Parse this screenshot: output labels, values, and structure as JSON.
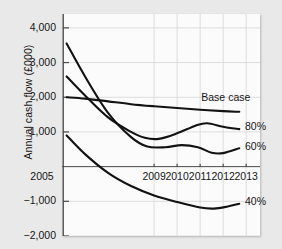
{
  "chart_data": {
    "type": "line",
    "title": "",
    "xlabel": "",
    "ylabel": "Annual cash flow (£000)",
    "xlim": [
      2005,
      2013.6
    ],
    "ylim": [
      -2000,
      4400
    ],
    "grid": true,
    "legend_position": "right-inline",
    "y_ticks": [
      4000,
      3000,
      2000,
      1000,
      -1000,
      -2000
    ],
    "y_tick_labels": [
      "4,000",
      "3,000",
      "2,000",
      "1,000",
      "−1,000",
      "−2,000"
    ],
    "x_ticks": [
      2005,
      2009,
      2010,
      2011,
      2012,
      2013
    ],
    "x_tick_labels": [
      "2005",
      "2009",
      "2010",
      "2011",
      "2012",
      "2013"
    ],
    "zero_axis": 0,
    "series": [
      {
        "name": "Base case",
        "label": "Base case",
        "color": "#121212",
        "x": [
          2005.2,
          2006.0,
          2007.0,
          2008.0,
          2009.0,
          2010.0,
          2011.0,
          2012.0,
          2012.7
        ],
        "values": [
          2000,
          1960,
          1880,
          1800,
          1740,
          1690,
          1640,
          1600,
          1580
        ]
      },
      {
        "name": "80%",
        "label": "80%",
        "color": "#121212",
        "x": [
          2005.2,
          2006.0,
          2007.0,
          2008.0,
          2008.6,
          2009.2,
          2010.0,
          2010.8,
          2011.3,
          2012.0,
          2012.7
        ],
        "values": [
          2600,
          2050,
          1420,
          1000,
          830,
          800,
          960,
          1180,
          1250,
          1150,
          1080
        ]
      },
      {
        "name": "60%",
        "label": "60%",
        "color": "#121212",
        "x": [
          2005.2,
          2006.0,
          2007.0,
          2008.0,
          2008.7,
          2009.5,
          2010.2,
          2010.9,
          2011.5,
          2012.0,
          2012.7
        ],
        "values": [
          3550,
          2600,
          1550,
          850,
          580,
          560,
          620,
          560,
          400,
          390,
          530
        ]
      },
      {
        "name": "40%",
        "label": "40%",
        "color": "#121212",
        "x": [
          2005.2,
          2006.0,
          2007.0,
          2008.0,
          2009.0,
          2010.0,
          2011.0,
          2011.6,
          2012.2,
          2012.7
        ],
        "values": [
          900,
          360,
          -180,
          -560,
          -830,
          -1020,
          -1180,
          -1210,
          -1150,
          -1070
        ]
      }
    ],
    "series_label_positions": [
      {
        "label": "Base case",
        "x": 2011.05,
        "y": 1980
      },
      {
        "label": "80%",
        "x": 2012.95,
        "y": 1130
      },
      {
        "label": "60%",
        "x": 2012.95,
        "y": 560
      },
      {
        "label": "40%",
        "x": 2012.95,
        "y": -1020
      }
    ]
  }
}
